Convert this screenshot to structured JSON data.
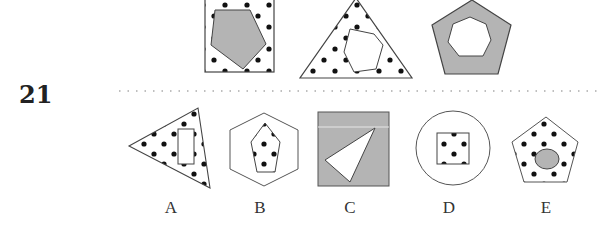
{
  "question": {
    "number": "21",
    "prompt_figures": [
      {
        "id": "fig1",
        "outer": "square",
        "outer_fill": "dots",
        "inner": "pentagon",
        "inner_fill": "gray"
      },
      {
        "id": "fig2",
        "outer": "triangle",
        "outer_fill": "dots",
        "inner": "hexagon",
        "inner_fill": "white"
      },
      {
        "id": "fig3",
        "outer": "pentagon",
        "outer_fill": "gray",
        "inner": "heptagon",
        "inner_fill": "white"
      }
    ],
    "options": [
      {
        "label": "A",
        "outer": "triangle",
        "outer_fill": "dots",
        "inner": "rectangle",
        "inner_fill": "white"
      },
      {
        "label": "B",
        "outer": "hexagon",
        "outer_fill": "white",
        "inner": "pentagon",
        "inner_fill": "dots"
      },
      {
        "label": "C",
        "outer": "square",
        "outer_fill": "gray",
        "inner": "triangle",
        "inner_fill": "white"
      },
      {
        "label": "D",
        "outer": "circle",
        "outer_fill": "white",
        "inner": "square",
        "inner_fill": "dots"
      },
      {
        "label": "E",
        "outer": "pentagon",
        "outer_fill": "dots",
        "inner": "ellipse",
        "inner_fill": "gray"
      }
    ]
  },
  "colors": {
    "gray_fill": "#b4b4b4",
    "stroke": "#444444",
    "dot": "#111111",
    "divider": "#aaaaaa"
  }
}
